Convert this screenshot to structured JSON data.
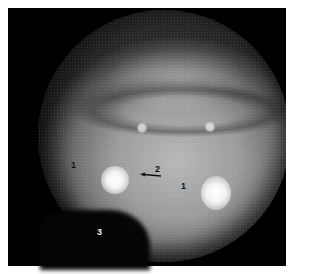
{
  "image": {
    "description": "Endoscopic circular view of mucosal tissue with numbered annotation labels",
    "background_color": "#ffffff",
    "frame_color": "#000000"
  },
  "annotations": {
    "label_1_left": "1",
    "label_1_right": "1",
    "label_2": "2",
    "label_3": "3",
    "arrow_direction": "left"
  }
}
